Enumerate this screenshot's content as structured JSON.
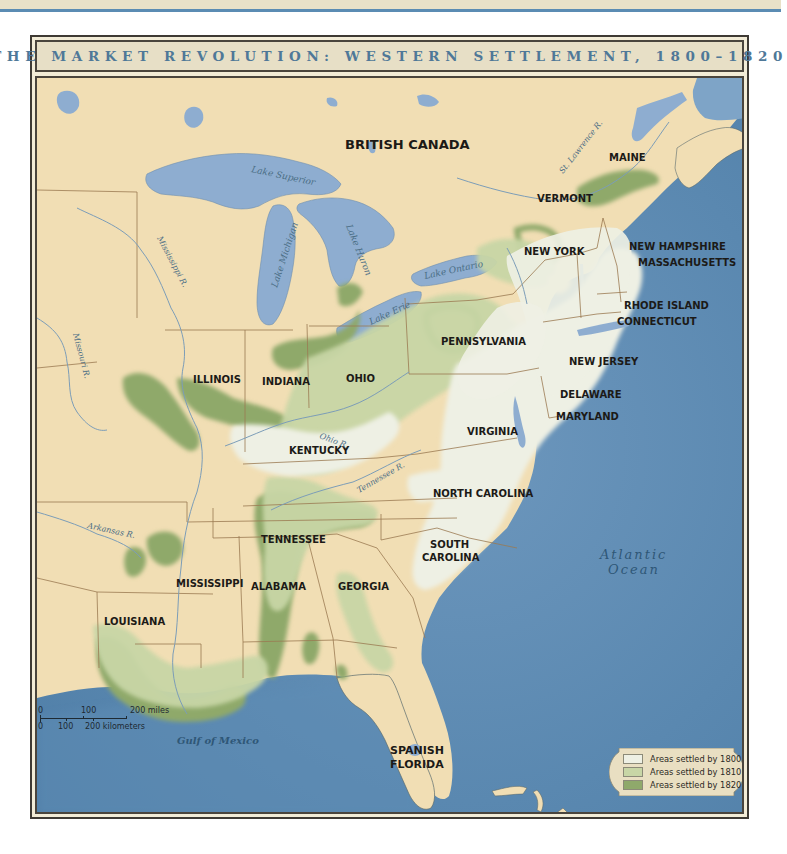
{
  "title": "THE MARKET REVOLUTION: WESTERN SETTLEMENT, 1800–1820",
  "colors": {
    "land_unsettled": "#f1deb4",
    "settled_1800": "#eef0e4",
    "settled_1810": "#c8d6a6",
    "settled_1820": "#8fa96b",
    "water": "#5f8db5",
    "lake": "#8eadd0",
    "border": "#9b7a52",
    "title_text": "#4f7898"
  },
  "regions": {
    "british_canada": "BRITISH CANADA",
    "spanish_florida_line1": "SPANISH",
    "spanish_florida_line2": "FLORIDA"
  },
  "states": [
    {
      "name": "MAINE"
    },
    {
      "name": "VERMONT"
    },
    {
      "name": "NEW HAMPSHIRE"
    },
    {
      "name": "MASSACHUSETTS"
    },
    {
      "name": "NEW YORK"
    },
    {
      "name": "RHODE ISLAND"
    },
    {
      "name": "CONNECTICUT"
    },
    {
      "name": "PENNSYLVANIA"
    },
    {
      "name": "NEW JERSEY"
    },
    {
      "name": "DELAWARE"
    },
    {
      "name": "MARYLAND"
    },
    {
      "name": "ILLINOIS"
    },
    {
      "name": "INDIANA"
    },
    {
      "name": "OHIO"
    },
    {
      "name": "KENTUCKY"
    },
    {
      "name": "VIRGINIA"
    },
    {
      "name": "TENNESSEE"
    },
    {
      "name": "NORTH CAROLINA"
    },
    {
      "name": "SOUTH",
      "line2": "CAROLINA"
    },
    {
      "name": "GEORGIA"
    },
    {
      "name": "ALABAMA"
    },
    {
      "name": "MISSISSIPPI"
    },
    {
      "name": "LOUISIANA"
    }
  ],
  "water_labels": {
    "lake_superior": "Lake Superior",
    "lake_michigan": "Lake Michigan",
    "lake_huron": "Lake Huron",
    "lake_ontario": "Lake Ontario",
    "lake_erie": "Lake Erie",
    "st_lawrence": "St. Lawrence R.",
    "mississippi": "Mississippi R.",
    "missouri": "Missouri R.",
    "ohio": "Ohio R.",
    "tennessee": "Tennessee R.",
    "arkansas": "Arkansas R.",
    "atlantic_line1": "Atlantic",
    "atlantic_line2": "Ocean",
    "gulf": "Gulf of Mexico"
  },
  "legend": [
    {
      "label": "Areas settled by 1800",
      "color": "#eef0e4"
    },
    {
      "label": "Areas settled by 1810",
      "color": "#c8d6a6"
    },
    {
      "label": "Areas settled by 1820",
      "color": "#8fa96b"
    }
  ],
  "scale": {
    "miles_ticks": [
      "0",
      "100",
      "200 miles"
    ],
    "km_ticks": [
      "0",
      "100",
      "200 kilometers"
    ]
  }
}
